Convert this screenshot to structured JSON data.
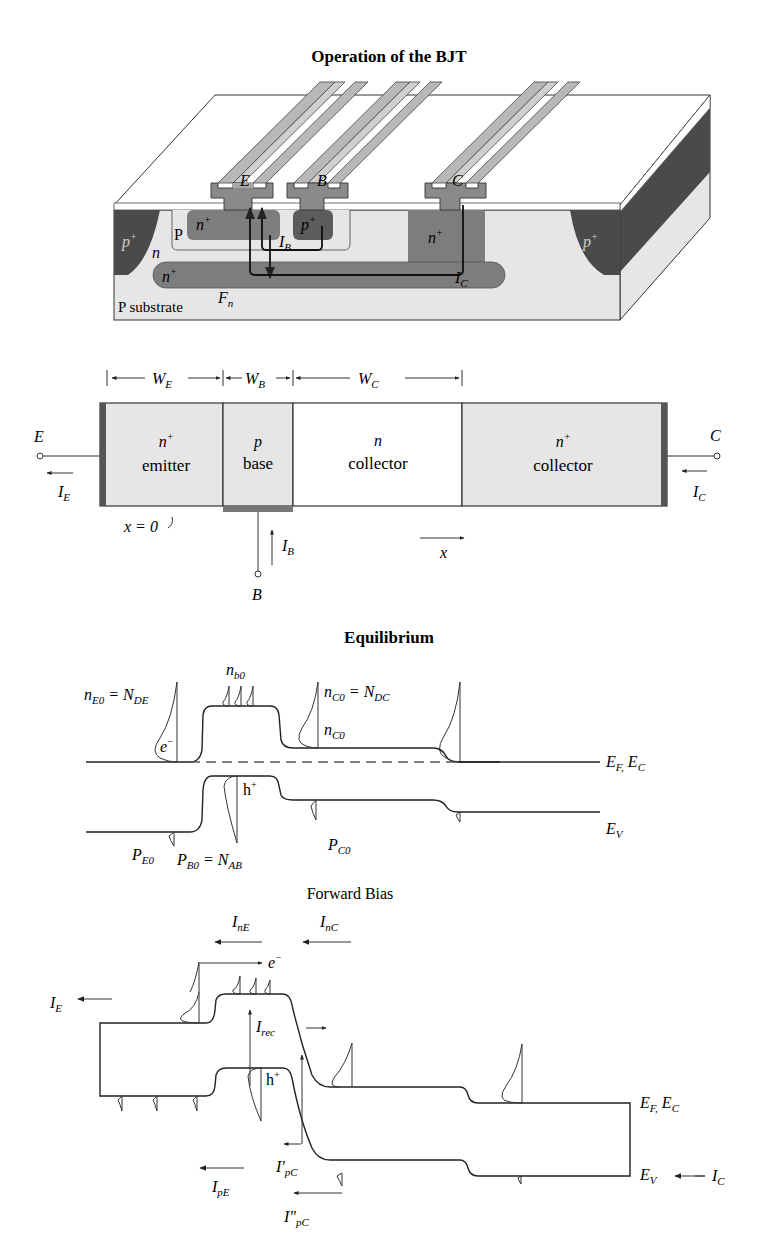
{
  "figure": {
    "title": "Operation of the BJT"
  },
  "structure_3d": {
    "terminals": [
      "E",
      "B",
      "C"
    ],
    "regions": {
      "left_isolation": "p+",
      "right_isolation": "p+",
      "emitter": "n+",
      "base_contact": "p+",
      "base_well": "P",
      "collector_epi": "n",
      "buried_layer": "n+",
      "collector_sinker": "n+",
      "substrate": "P substrate"
    },
    "currents": {
      "base": "I_B",
      "collector": "I_C",
      "flux": "F_n"
    }
  },
  "cross_section": {
    "widths": [
      "W_E",
      "W_B",
      "W_C"
    ],
    "regions": [
      {
        "doping": "n+",
        "name": "emitter"
      },
      {
        "doping": "p",
        "name": "base"
      },
      {
        "doping": "n",
        "name": "collector"
      },
      {
        "doping": "n+",
        "name": "collector"
      }
    ],
    "terminals": {
      "emitter": "E",
      "base": "B",
      "collector": "C"
    },
    "currents": {
      "emitter": "I_E",
      "base": "I_B",
      "collector": "I_C"
    },
    "origin_label": "x = 0",
    "axis_label": "x"
  },
  "equilibrium": {
    "title": "Equilibrium",
    "labels": {
      "emitter_electrons": "n_E0 = N_DE",
      "electron_symbol": "e⁻",
      "base_electrons": "n_b0",
      "collector_electrons_top": "n_C0 = N_DC",
      "collector_electrons": "n_C0",
      "hole_symbol": "h⁺",
      "emitter_holes": "P_E0",
      "base_holes": "P_B0 = N_AB",
      "collector_holes": "P_C0",
      "conduction_band": "E_F, E_C",
      "valence_band": "E_V"
    }
  },
  "forward_bias": {
    "title": "Forward Bias",
    "labels": {
      "I_E": "I_E",
      "I_nE": "I_nE",
      "I_nC": "I_nC",
      "electron_symbol": "e⁻",
      "I_rec": "I_rec",
      "hole_symbol": "h⁺",
      "I_pE": "I_pE",
      "I_pC_prime": "I'_pC",
      "I_pC_double_prime": "I''_pC",
      "conduction_band": "E_F, E_C",
      "valence_band": "E_V",
      "I_C": "I_C"
    }
  },
  "colors": {
    "dark_region": "#4a4a4a",
    "mid_region": "#7d7d7d",
    "light_region": "#cfcfcf",
    "metal": "#a8a8a8",
    "metal_dark": "#8a8a8a",
    "oxide": "#ffffff",
    "substrate": "#e6e6e6"
  }
}
